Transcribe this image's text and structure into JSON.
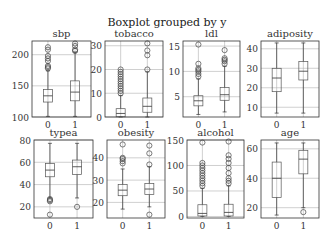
{
  "chart_data": [
    {
      "type": "boxplot",
      "title": "sbp",
      "categories": [
        "0",
        "1"
      ],
      "ylim": [
        100,
        222
      ],
      "yticks": [
        100,
        150,
        200
      ],
      "series": [
        {
          "name": "0",
          "whislo": 101,
          "q1": 124,
          "med": 134,
          "q3": 144,
          "whishi": 174,
          "fliers": [
            178,
            180,
            182,
            190,
            194,
            198,
            208,
            212
          ]
        },
        {
          "name": "1",
          "whislo": 101,
          "q1": 126,
          "med": 140,
          "q3": 158,
          "whishi": 204,
          "fliers": [
            206,
            208,
            214,
            218
          ]
        }
      ]
    },
    {
      "type": "boxplot",
      "title": "tobacco",
      "categories": [
        "0",
        "1"
      ],
      "ylim": [
        0,
        32
      ],
      "yticks": [
        0,
        10,
        20,
        30
      ],
      "series": [
        {
          "name": "0",
          "whislo": 0,
          "q1": 0.1,
          "med": 1.5,
          "q3": 3.5,
          "whishi": 9,
          "fliers": [
            10,
            11,
            12,
            13,
            14,
            15,
            16,
            17,
            18,
            19,
            20
          ]
        },
        {
          "name": "1",
          "whislo": 0,
          "q1": 2,
          "med": 4.5,
          "q3": 8,
          "whishi": 19,
          "fliers": [
            20,
            26,
            28,
            31
          ]
        }
      ]
    },
    {
      "type": "boxplot",
      "title": "ldl",
      "categories": [
        "0",
        "1"
      ],
      "ylim": [
        1,
        16
      ],
      "yticks": [
        5,
        10,
        15
      ],
      "series": [
        {
          "name": "0",
          "whislo": 1.5,
          "q1": 3.2,
          "med": 4.2,
          "q3": 5.2,
          "whishi": 8.5,
          "fliers": [
            9,
            9.5,
            10,
            10.3,
            10.6,
            11.5,
            15.3
          ]
        },
        {
          "name": "1",
          "whislo": 2,
          "q1": 4.3,
          "med": 5.4,
          "q3": 6.8,
          "whishi": 11,
          "fliers": [
            11.5,
            12,
            12.3,
            12.6,
            14.2
          ]
        }
      ]
    },
    {
      "type": "boxplot",
      "title": "adiposity",
      "categories": [
        "0",
        "1"
      ],
      "ylim": [
        5,
        44
      ],
      "yticks": [
        10,
        20,
        30,
        40
      ],
      "series": [
        {
          "name": "0",
          "whislo": 7,
          "q1": 18,
          "med": 25,
          "q3": 30,
          "whishi": 43,
          "fliers": []
        },
        {
          "name": "1",
          "whislo": 7,
          "q1": 24,
          "med": 28.5,
          "q3": 33.5,
          "whishi": 43,
          "fliers": []
        }
      ]
    },
    {
      "type": "boxplot",
      "title": "typea",
      "categories": [
        "0",
        "1"
      ],
      "ylim": [
        10,
        80
      ],
      "yticks": [
        20,
        40,
        60,
        80
      ],
      "series": [
        {
          "name": "0",
          "whislo": 28,
          "q1": 47,
          "med": 53,
          "q3": 59,
          "whishi": 77,
          "fliers": [
            25,
            26,
            27,
            13
          ]
        },
        {
          "name": "1",
          "whislo": 28,
          "q1": 49,
          "med": 56,
          "q3": 62,
          "whishi": 77,
          "fliers": [
            20
          ]
        }
      ]
    },
    {
      "type": "boxplot",
      "title": "obesity",
      "categories": [
        "0",
        "1"
      ],
      "ylim": [
        13,
        48
      ],
      "yticks": [
        20,
        30,
        40
      ],
      "series": [
        {
          "name": "0",
          "whislo": 17,
          "q1": 23,
          "med": 25.5,
          "q3": 28,
          "whishi": 35,
          "fliers": [
            37.5,
            38.5,
            39.5,
            40,
            46
          ]
        },
        {
          "name": "1",
          "whislo": 18,
          "q1": 23.5,
          "med": 26,
          "q3": 28.5,
          "whishi": 36,
          "fliers": [
            37,
            42,
            45.5,
            14.5
          ]
        }
      ]
    },
    {
      "type": "boxplot",
      "title": "alcohol",
      "categories": [
        "0",
        "1"
      ],
      "ylim": [
        -3,
        150
      ],
      "yticks": [
        0,
        50,
        100,
        150
      ],
      "series": [
        {
          "name": "0",
          "whislo": 0,
          "q1": 1,
          "med": 6,
          "q3": 23,
          "whishi": 55,
          "fliers": [
            60,
            65,
            70,
            75,
            80,
            85,
            90,
            95,
            100,
            105,
            145
          ]
        },
        {
          "name": "1",
          "whislo": 0,
          "q1": 1,
          "med": 8,
          "q3": 24,
          "whishi": 60,
          "fliers": [
            65,
            70,
            75,
            85,
            95,
            105,
            113,
            120,
            147
          ]
        }
      ]
    },
    {
      "type": "boxplot",
      "title": "age",
      "categories": [
        "0",
        "1"
      ],
      "ylim": [
        13,
        66
      ],
      "yticks": [
        20,
        40,
        60
      ],
      "series": [
        {
          "name": "0",
          "whislo": 15,
          "q1": 27,
          "med": 40,
          "q3": 51,
          "whishi": 64,
          "fliers": []
        },
        {
          "name": "1",
          "whislo": 20,
          "q1": 43,
          "med": 53,
          "q3": 59,
          "whishi": 64,
          "fliers": [
            17
          ]
        }
      ]
    }
  ],
  "figure": {
    "suptitle": "Boxplot grouped by y",
    "grid": true,
    "xtick_labels": [
      "0",
      "1"
    ]
  }
}
